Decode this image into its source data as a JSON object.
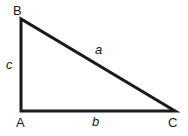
{
  "diagram": {
    "type": "right-triangle",
    "stroke_color": "#1a1a1a",
    "vertices": [
      {
        "label": "A",
        "x": 21,
        "y": 111
      },
      {
        "label": "B",
        "x": 21,
        "y": 19
      },
      {
        "label": "C",
        "x": 175,
        "y": 111
      }
    ],
    "sides": [
      {
        "label": "a",
        "between": "B-C"
      },
      {
        "label": "b",
        "between": "A-C"
      },
      {
        "label": "c",
        "between": "A-B"
      }
    ],
    "right_angle_at": "A"
  },
  "labels": {
    "A": "A",
    "B": "B",
    "C": "C",
    "a": "a",
    "b": "b",
    "c": "c"
  }
}
